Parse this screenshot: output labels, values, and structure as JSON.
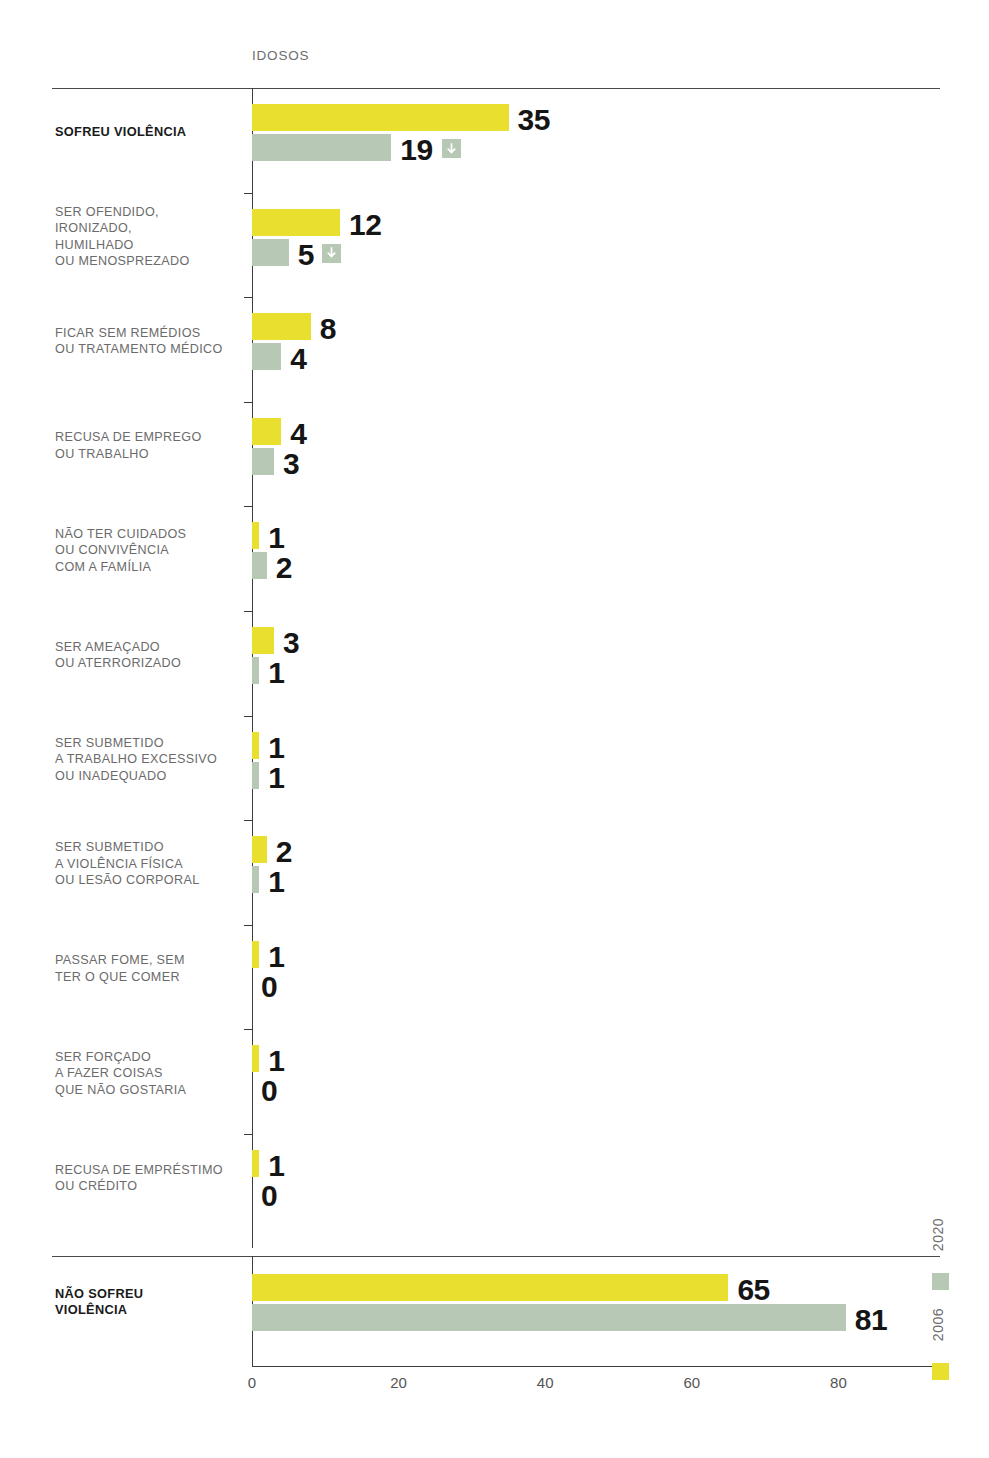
{
  "chart_title": "IDOSOS",
  "legend": {
    "position": "right-vertical",
    "entries": [
      {
        "label": "2020",
        "color": "#b7c9b5"
      },
      {
        "label": "2006",
        "color": "#e8df2e"
      }
    ]
  },
  "axis": {
    "xlabel": "",
    "ticks": [
      "0",
      "20",
      "40",
      "60",
      "80"
    ],
    "xlim": [
      0,
      94
    ]
  },
  "icons": {
    "down_arrow": "arrow-down-icon"
  },
  "chart_data": {
    "type": "bar",
    "orientation": "horizontal",
    "title": "IDOSOS",
    "xlabel": "",
    "ylabel": "",
    "xlim": [
      0,
      94
    ],
    "xticks": [
      0,
      20,
      40,
      60,
      80
    ],
    "grid": false,
    "legend_position": "right",
    "series": [
      {
        "name": "2006",
        "color": "#e8df2e"
      },
      {
        "name": "2020",
        "color": "#b7c9b5"
      }
    ],
    "categories": [
      "SOFREU VIOLÊNCIA",
      "SER OFENDIDO, IRONIZADO, HUMILHADO OU MENOSPREZADO",
      "FICAR SEM REMÉDIOS OU TRATAMENTO MÉDICO",
      "RECUSA DE EMPREGO OU TRABALHO",
      "NÃO TER CUIDADOS OU CONVIVÊNCIA COM A FAMÍLIA",
      "SER AMEAÇADO OU ATERRORIZADO",
      "SER SUBMETIDO A TRABALHO EXCESSIVO OU INADEQUADO",
      "SER SUBMETIDO A VIOLÊNCIA FÍSICA OU LESÃO CORPORAL",
      "PASSAR FOME, SEM TER O QUE COMER",
      "SER FORÇADO A FAZER COISAS QUE NÃO GOSTARIA",
      "RECUSA DE EMPRÉSTIMO OU CRÉDITO",
      "NÃO SOFREU VIOLÊNCIA"
    ],
    "values_2006": [
      35,
      12,
      8,
      4,
      1,
      3,
      1,
      2,
      1,
      1,
      1,
      65
    ],
    "values_2020": [
      19,
      5,
      4,
      3,
      2,
      1,
      1,
      1,
      0,
      0,
      0,
      81
    ],
    "annotations": [
      {
        "category": "SOFREU VIOLÊNCIA",
        "series": "2020",
        "marker": "arrow-down"
      },
      {
        "category": "SER OFENDIDO, IRONIZADO, HUMILHADO OU MENOSPREZADO",
        "series": "2020",
        "marker": "arrow-down"
      }
    ]
  },
  "rows": [
    {
      "label_lines": [
        "SOFREU VIOLÊNCIA"
      ],
      "bold": true,
      "v2006": "35",
      "v2020": "19",
      "arrow": true
    },
    {
      "label_lines": [
        "SER OFENDIDO,",
        "IRONIZADO,",
        "HUMILHADO",
        "OU MENOSPREZADO"
      ],
      "bold": false,
      "v2006": "12",
      "v2020": "5",
      "arrow": true
    },
    {
      "label_lines": [
        "FICAR SEM REMÉDIOS",
        "OU TRATAMENTO MÉDICO"
      ],
      "bold": false,
      "v2006": "8",
      "v2020": "4",
      "arrow": false
    },
    {
      "label_lines": [
        "RECUSA DE EMPREGO",
        "OU TRABALHO"
      ],
      "bold": false,
      "v2006": "4",
      "v2020": "3",
      "arrow": false
    },
    {
      "label_lines": [
        "NÃO TER CUIDADOS",
        "OU CONVIVÊNCIA",
        "COM A FAMÍLIA"
      ],
      "bold": false,
      "v2006": "1",
      "v2020": "2",
      "arrow": false
    },
    {
      "label_lines": [
        "SER AMEAÇADO",
        "OU ATERRORIZADO"
      ],
      "bold": false,
      "v2006": "3",
      "v2020": "1",
      "arrow": false
    },
    {
      "label_lines": [
        "SER SUBMETIDO",
        "A TRABALHO EXCESSIVO",
        "OU INADEQUADO"
      ],
      "bold": false,
      "v2006": "1",
      "v2020": "1",
      "arrow": false
    },
    {
      "label_lines": [
        "SER SUBMETIDO",
        "A VIOLÊNCIA FÍSICA",
        "OU LESÃO CORPORAL"
      ],
      "bold": false,
      "v2006": "2",
      "v2020": "1",
      "arrow": false
    },
    {
      "label_lines": [
        "PASSAR FOME, SEM",
        "TER O QUE COMER"
      ],
      "bold": false,
      "v2006": "1",
      "v2020": "0",
      "arrow": false
    },
    {
      "label_lines": [
        "SER FORÇADO",
        "A FAZER COISAS",
        "QUE NÃO GOSTARIA"
      ],
      "bold": false,
      "v2006": "1",
      "v2020": "0",
      "arrow": false
    },
    {
      "label_lines": [
        "RECUSA DE EMPRÉSTIMO",
        "OU CRÉDITO"
      ],
      "bold": false,
      "v2006": "1",
      "v2020": "0",
      "arrow": false
    },
    {
      "label_lines": [
        "NÃO SOFREU",
        "VIOLÊNCIA"
      ],
      "bold": true,
      "v2006": "65",
      "v2020": "81",
      "arrow": false
    }
  ]
}
